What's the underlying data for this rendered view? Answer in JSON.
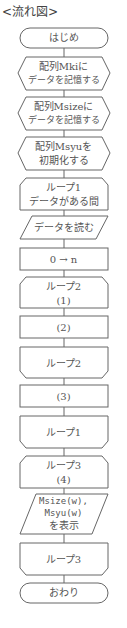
{
  "title": "<流れ図>",
  "flowchart": {
    "nodes": [
      {
        "id": "start",
        "type": "terminal",
        "lines": [
          "はじめ"
        ]
      },
      {
        "id": "prep1",
        "type": "preparation",
        "lines": [
          "配列Mkiに",
          "データを記憶する"
        ]
      },
      {
        "id": "prep2",
        "type": "preparation",
        "lines": [
          "配列Msizeに",
          "データを記憶する"
        ]
      },
      {
        "id": "prep3",
        "type": "preparation",
        "lines": [
          "配列Msyuを",
          "初期化する"
        ]
      },
      {
        "id": "loop1_start",
        "type": "loop-start",
        "lines": [
          "ループ1",
          "データがある間"
        ]
      },
      {
        "id": "read",
        "type": "io",
        "lines": [
          "データを読む"
        ]
      },
      {
        "id": "assign",
        "type": "process",
        "lines": [
          "0 → n"
        ]
      },
      {
        "id": "loop2_start",
        "type": "loop-start",
        "lines": [
          "ループ2",
          "(1)"
        ]
      },
      {
        "id": "blank2",
        "type": "process",
        "lines": [
          "(2)"
        ]
      },
      {
        "id": "loop2_end",
        "type": "loop-end",
        "lines": [
          "ループ2"
        ]
      },
      {
        "id": "blank3",
        "type": "process",
        "lines": [
          "(3)"
        ]
      },
      {
        "id": "loop1_end",
        "type": "loop-end",
        "lines": [
          "ループ1"
        ]
      },
      {
        "id": "loop3_start",
        "type": "loop-start",
        "lines": [
          "ループ3",
          "(4)"
        ]
      },
      {
        "id": "output",
        "type": "io",
        "lines": [
          "Msize(w),",
          "Msyu(w)",
          "を表示"
        ]
      },
      {
        "id": "loop3_end",
        "type": "loop-end",
        "lines": [
          "ループ3"
        ]
      },
      {
        "id": "end",
        "type": "terminal",
        "lines": [
          "おわり"
        ]
      }
    ]
  },
  "labels": {
    "start": "はじめ",
    "prep1_l1": "配列Mkiに",
    "prep1_l2": "データを記憶する",
    "prep2_l1": "配列Msizeに",
    "prep2_l2": "データを記憶する",
    "prep3_l1": "配列Msyuを",
    "prep3_l2": "初期化する",
    "loop1_l1": "ループ1",
    "loop1_l2": "データがある間",
    "read": "データを読む",
    "assign": "0 → n",
    "loop2_l1": "ループ2",
    "loop2_l2": "(1)",
    "blank2": "(2)",
    "loop2_end": "ループ2",
    "blank3": "(3)",
    "loop1_end": "ループ1",
    "loop3_l1": "ループ3",
    "loop3_l2": "(4)",
    "out_l1": "Msize(w),",
    "out_l2": "Msyu(w)",
    "out_l3": "を表示",
    "loop3_end": "ループ3",
    "end": "おわり"
  },
  "colors": {
    "stroke": "#666666",
    "text": "#555555",
    "background": "#ffffff"
  }
}
